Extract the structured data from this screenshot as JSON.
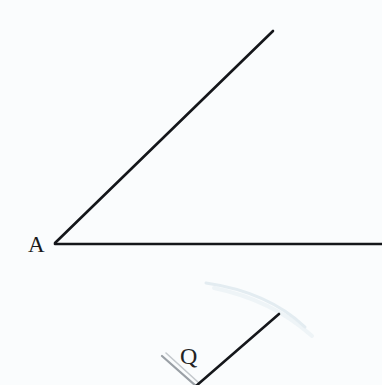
{
  "page": {
    "background_color": "#fafcfd",
    "width": 382,
    "height": 385
  },
  "figures": {
    "angle_a": {
      "label": "A",
      "label_x": 28,
      "label_y": 252,
      "vertex_x": 55,
      "vertex_y": 243,
      "stroke_color": "#14161a",
      "stroke_width": 2.6,
      "rays": [
        {
          "name": "upper-ray",
          "x1": 55,
          "y1": 243,
          "x2": 273,
          "y2": 31
        },
        {
          "name": "horizontal-ray",
          "x1": 55,
          "y1": 244,
          "x2": 382,
          "y2": 244
        }
      ]
    },
    "angle_q": {
      "label": "Q",
      "label_x": 180,
      "label_y": 364,
      "vertex_x": 196,
      "vertex_y": 386,
      "stroke_color": "#15171b",
      "stroke_width": 2.6,
      "rays": [
        {
          "name": "right-ray",
          "x1": 196,
          "y1": 386,
          "x2": 279,
          "y2": 314,
          "color": "#15171b",
          "width": 2.6
        },
        {
          "name": "left-ray",
          "x1": 196,
          "y1": 386,
          "x2": 162,
          "y2": 356,
          "color": "#9aa0a6",
          "width": 2.2
        },
        {
          "name": "left-ray-shadow",
          "x1": 199,
          "y1": 383,
          "x2": 166,
          "y2": 353,
          "color": "#c3c8cc",
          "width": 1.6
        }
      ]
    }
  },
  "artifacts": {
    "scan_arc": {
      "name": "faint-scan-arc",
      "color": "#e3ecf1",
      "width": 3,
      "path": "M 206 283 Q 268 292 305 327"
    },
    "scan_arc_secondary": {
      "name": "faint-scan-arc-secondary",
      "color": "#eef4f7",
      "width": 4,
      "path": "M 214 288 Q 272 300 312 336"
    }
  }
}
